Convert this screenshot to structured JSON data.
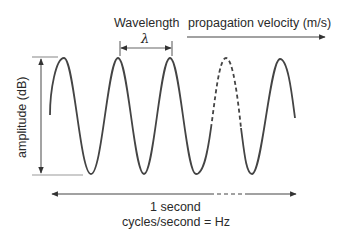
{
  "diagram": {
    "type": "sine-wave-annotation",
    "labels": {
      "wavelength": "Wavelength",
      "lambda_symbol": "λ",
      "propagation": "propagation velocity (m/s)",
      "amplitude": "amplitude (dB)",
      "duration": "1 second",
      "frequency": "cycles/second = Hz"
    },
    "wave": {
      "cycles_shown": 5,
      "dashed_cycle_index": 4,
      "color": "#444444"
    },
    "colors": {
      "wave": "#444444",
      "annotation": "#555555",
      "guide_lines": "#999999",
      "text": "#2a2a2a"
    }
  }
}
